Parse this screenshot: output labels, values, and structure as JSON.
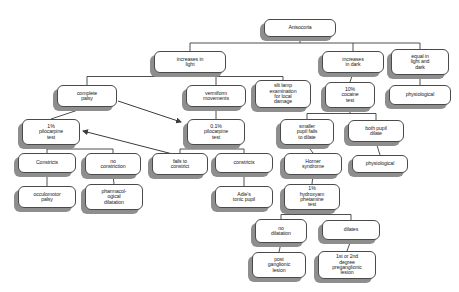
{
  "diagram": {
    "type": "flowchart",
    "style": {
      "node_fill": "#ffffff",
      "node_border": "#4a4a4a",
      "shadow_color": "#8e8e8e",
      "edge_color": "#3c3c3c",
      "text_color": "#1a1a1a",
      "background": "#ffffff"
    },
    "nodes": [
      {
        "id": "anisocoria",
        "label": "Anisocoria",
        "x": 264,
        "y": 19,
        "w": 72,
        "h": 18,
        "fs": 5.2
      },
      {
        "id": "increases_light",
        "label": "increases in\nlight",
        "x": 154,
        "y": 51,
        "w": 72,
        "h": 22,
        "fs": 5.2
      },
      {
        "id": "increases_dark",
        "label": "increases\nin dark",
        "x": 322,
        "y": 51,
        "w": 62,
        "h": 22,
        "fs": 5.2
      },
      {
        "id": "equal_light_dark",
        "label": "equal in\nlight and\ndark",
        "x": 391,
        "y": 49,
        "w": 58,
        "h": 26,
        "fs": 5.2
      },
      {
        "id": "complete_palsy",
        "label": "complete\npalsy",
        "x": 57,
        "y": 85,
        "w": 60,
        "h": 22,
        "fs": 5.2
      },
      {
        "id": "vermiform",
        "label": "vermiform\nmovements",
        "x": 186,
        "y": 85,
        "w": 60,
        "h": 22,
        "fs": 5.2
      },
      {
        "id": "slit_lamp",
        "label": "slit lamp\nexamination\nfor local\ndamage",
        "x": 255,
        "y": 80,
        "w": 56,
        "h": 28,
        "fs": 5.2
      },
      {
        "id": "cocaine_test",
        "label": "10%\ncocaine\ntest",
        "x": 325,
        "y": 82,
        "w": 50,
        "h": 26,
        "fs": 5.2
      },
      {
        "id": "physiological_a",
        "label": "physiological",
        "x": 389,
        "y": 85,
        "w": 62,
        "h": 20,
        "fs": 5.2
      },
      {
        "id": "pilo_1",
        "label": "1%\npilocarpine\ntest",
        "x": 22,
        "y": 119,
        "w": 58,
        "h": 26,
        "fs": 5.2
      },
      {
        "id": "pilo_01",
        "label": "0.1%\npilocarpine\ntest",
        "x": 187,
        "y": 119,
        "w": 58,
        "h": 26,
        "fs": 5.2
      },
      {
        "id": "smaller_pupil",
        "label": "smaller\npupil fails\nto dilate",
        "x": 280,
        "y": 119,
        "w": 54,
        "h": 26,
        "fs": 5.2
      },
      {
        "id": "both_pupil",
        "label": "both pupil\ndilate",
        "x": 348,
        "y": 120,
        "w": 56,
        "h": 22,
        "fs": 5.2
      },
      {
        "id": "constricts_a",
        "label": "Constricts",
        "x": 18,
        "y": 153,
        "w": 58,
        "h": 20,
        "fs": 5.2
      },
      {
        "id": "no_constriction",
        "label": "no\nconstriction",
        "x": 85,
        "y": 153,
        "w": 56,
        "h": 22,
        "fs": 5.2
      },
      {
        "id": "fails_constrict",
        "label": "fails to\nconstrict",
        "x": 152,
        "y": 153,
        "w": 56,
        "h": 22,
        "fs": 5.2
      },
      {
        "id": "constricts_b",
        "label": "constricts",
        "x": 215,
        "y": 153,
        "w": 58,
        "h": 20,
        "fs": 5.2
      },
      {
        "id": "horner",
        "label": "Horner\nsyndrome",
        "x": 284,
        "y": 153,
        "w": 58,
        "h": 22,
        "fs": 5.2
      },
      {
        "id": "physiological_b",
        "label": "physiological",
        "x": 352,
        "y": 155,
        "w": 56,
        "h": 18,
        "fs": 5.2
      },
      {
        "id": "occulomotor",
        "label": "occulomotor\npalsy",
        "x": 18,
        "y": 186,
        "w": 58,
        "h": 22,
        "fs": 5.2
      },
      {
        "id": "pharmacological",
        "label": "pharmacol-\nogical\ndilatation",
        "x": 85,
        "y": 184,
        "w": 58,
        "h": 26,
        "fs": 5.2
      },
      {
        "id": "adies",
        "label": "Adie's\ntonic pupil",
        "x": 215,
        "y": 186,
        "w": 58,
        "h": 22,
        "fs": 5.2
      },
      {
        "id": "hydroxyamphetamine",
        "label": "1%\nhydroxyam\nphetamine\ntest",
        "x": 284,
        "y": 184,
        "w": 56,
        "h": 26,
        "fs": 5.2
      },
      {
        "id": "no_dilatation",
        "label": "no\ndilatation",
        "x": 255,
        "y": 219,
        "w": 52,
        "h": 24,
        "fs": 5.2
      },
      {
        "id": "dilates",
        "label": "dilates",
        "x": 322,
        "y": 220,
        "w": 58,
        "h": 20,
        "fs": 5.2
      },
      {
        "id": "post_ganglionic",
        "label": "post\nganglionic\nlesion",
        "x": 252,
        "y": 252,
        "w": 54,
        "h": 26,
        "fs": 5.2
      },
      {
        "id": "preganglionic",
        "label": "1st or 2nd\ndegree\npreganglionic\nlesion",
        "x": 318,
        "y": 251,
        "w": 58,
        "h": 28,
        "fs": 5.2
      }
    ],
    "edges": [
      {
        "from": "anisocoria",
        "to": "increases_light",
        "kind": "elbow"
      },
      {
        "from": "anisocoria",
        "to": "increases_dark",
        "kind": "elbow"
      },
      {
        "from": "anisocoria",
        "to": "equal_light_dark",
        "kind": "elbow"
      },
      {
        "from": "increases_light",
        "to": "complete_palsy",
        "kind": "elbow"
      },
      {
        "from": "increases_light",
        "to": "vermiform",
        "kind": "elbow"
      },
      {
        "from": "increases_light",
        "to": "slit_lamp",
        "kind": "elbow"
      },
      {
        "from": "increases_dark",
        "to": "cocaine_test",
        "kind": "straight"
      },
      {
        "from": "equal_light_dark",
        "to": "physiological_a",
        "kind": "straight"
      },
      {
        "from": "complete_palsy",
        "to": "pilo_1",
        "kind": "straight"
      },
      {
        "from": "vermiform",
        "to": "pilo_01",
        "kind": "straight"
      },
      {
        "from": "cocaine_test",
        "to": "smaller_pupil",
        "kind": "elbow"
      },
      {
        "from": "cocaine_test",
        "to": "both_pupil",
        "kind": "elbow"
      },
      {
        "from": "pilo_1",
        "to": "constricts_a",
        "kind": "elbow"
      },
      {
        "from": "pilo_1",
        "to": "no_constriction",
        "kind": "elbow"
      },
      {
        "from": "pilo_01",
        "to": "fails_constrict",
        "kind": "elbow"
      },
      {
        "from": "pilo_01",
        "to": "constricts_b",
        "kind": "elbow"
      },
      {
        "from": "smaller_pupil",
        "to": "horner",
        "kind": "straight"
      },
      {
        "from": "both_pupil",
        "to": "physiological_b",
        "kind": "straight"
      },
      {
        "from": "constricts_a",
        "to": "occulomotor",
        "kind": "straight"
      },
      {
        "from": "no_constriction",
        "to": "pharmacological",
        "kind": "straight"
      },
      {
        "from": "constricts_b",
        "to": "adies",
        "kind": "straight"
      },
      {
        "from": "horner",
        "to": "hydroxyamphetamine",
        "kind": "straight"
      },
      {
        "from": "hydroxyamphetamine",
        "to": "no_dilatation",
        "kind": "elbow"
      },
      {
        "from": "hydroxyamphetamine",
        "to": "dilates",
        "kind": "elbow"
      },
      {
        "from": "no_dilatation",
        "to": "post_ganglionic",
        "kind": "straight"
      },
      {
        "from": "dilates",
        "to": "preganglionic",
        "kind": "straight"
      }
    ],
    "arrows": [
      {
        "id": "arrow-complete-palsy-to-pilo01",
        "x1": 118,
        "y1": 101,
        "x2": 181,
        "y2": 122
      },
      {
        "id": "arrow-to-pilo1",
        "x1": 196,
        "y1": 160,
        "x2": 83,
        "y2": 131
      }
    ]
  }
}
